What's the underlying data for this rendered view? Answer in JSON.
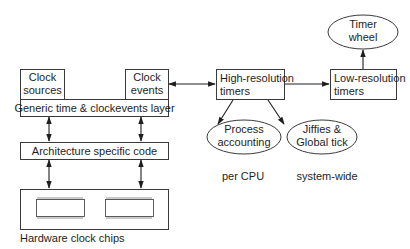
{
  "diagram": {
    "nodes": {
      "clock_sources": {
        "lines": [
          "Clock",
          "sources"
        ]
      },
      "clock_events": {
        "lines": [
          "Clock",
          "events"
        ]
      },
      "generic_layer": {
        "label": "Generic time & clockevents layer"
      },
      "architecture": {
        "label": "Architecture specific code"
      },
      "hardware": {
        "label": "Hardware clock chips",
        "chip_count": 2
      },
      "high_res": {
        "lines": [
          "High-resolution",
          "timers"
        ]
      },
      "low_res": {
        "lines": [
          "Low-resolution",
          "timers"
        ]
      },
      "timer_wheel": {
        "lines": [
          "Timer",
          "wheel"
        ]
      },
      "process_accounting": {
        "lines": [
          "Process",
          "accounting"
        ],
        "caption": "per CPU"
      },
      "jiffies": {
        "lines": [
          "Jiffies &",
          "Global tick"
        ],
        "caption": "system-wide"
      }
    },
    "edges": [
      {
        "from": "clock_events",
        "to": "high_res",
        "direction": "both"
      },
      {
        "from": "high_res",
        "to": "low_res",
        "direction": "forward"
      },
      {
        "from": "low_res",
        "to": "timer_wheel",
        "direction": "forward"
      },
      {
        "from": "high_res",
        "to": "process_accounting",
        "direction": "forward"
      },
      {
        "from": "high_res",
        "to": "jiffies",
        "direction": "forward"
      },
      {
        "from": "generic_layer",
        "to": "architecture",
        "direction": "both",
        "count": 2
      },
      {
        "from": "architecture",
        "to": "hardware",
        "direction": "both",
        "count": 2
      }
    ]
  }
}
